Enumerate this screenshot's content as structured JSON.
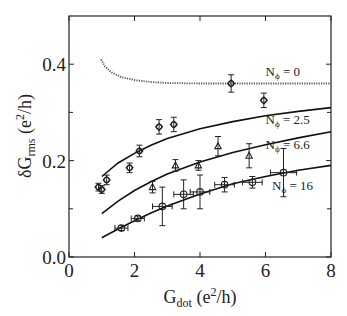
{
  "chart_data": {
    "type": "scatter",
    "title": "",
    "xlabel": "G_dot (e^2/h)",
    "ylabel": "δG_rms (e^2/h)",
    "xlim": [
      0,
      8
    ],
    "ylim": [
      0,
      0.5
    ],
    "x_ticks": [
      0,
      2,
      4,
      6,
      8
    ],
    "x_tick_labels": [
      "0",
      "2",
      "4",
      "6",
      "8"
    ],
    "y_ticks": [
      0.0,
      0.2,
      0.4
    ],
    "y_tick_labels": [
      "0.0",
      "0.2",
      "0.4"
    ],
    "y_minor_ticks": [
      0.1,
      0.3
    ],
    "grid": false,
    "series": [
      {
        "name": "Nφ = 0",
        "label_main": "N",
        "label_sub": "ϕ",
        "label_rest": " = 0",
        "marker": "circle-diamond",
        "points": [
          {
            "x": 4.95,
            "y": 0.36,
            "yerr": 0.018
          },
          {
            "x": 5.95,
            "y": 0.325,
            "yerr": 0.015
          }
        ],
        "curve_style": "dotted",
        "curve": [
          [
            0.98,
            0.41
          ],
          [
            1.1,
            0.395
          ],
          [
            1.3,
            0.383
          ],
          [
            1.6,
            0.373
          ],
          [
            2.0,
            0.367
          ],
          [
            2.5,
            0.363
          ],
          [
            3.0,
            0.361
          ],
          [
            4.0,
            0.36
          ],
          [
            5.0,
            0.36
          ],
          [
            6.0,
            0.36
          ],
          [
            7.0,
            0.36
          ],
          [
            8.0,
            0.36
          ]
        ],
        "label_pos": [
          6.0,
          0.375
        ]
      },
      {
        "name": "Nφ = 2.5",
        "label_main": "N",
        "label_sub": "ϕ",
        "label_rest": " = 2.5",
        "marker": "circle-diamond",
        "points": [
          {
            "x": 0.9,
            "y": 0.145,
            "yerr": 0.008
          },
          {
            "x": 1.0,
            "y": 0.14,
            "yerr": 0.008
          },
          {
            "x": 1.15,
            "y": 0.16,
            "yerr": 0.01
          },
          {
            "x": 1.85,
            "y": 0.185,
            "yerr": 0.01
          },
          {
            "x": 2.15,
            "y": 0.22,
            "yerr": 0.012
          },
          {
            "x": 2.75,
            "y": 0.27,
            "yerr": 0.015
          },
          {
            "x": 3.2,
            "y": 0.275,
            "yerr": 0.015
          }
        ],
        "curve_style": "solid",
        "curve": [
          [
            1.0,
            0.167
          ],
          [
            1.5,
            0.195
          ],
          [
            2.0,
            0.215
          ],
          [
            2.5,
            0.232
          ],
          [
            3.0,
            0.246
          ],
          [
            4.0,
            0.266
          ],
          [
            5.0,
            0.281
          ],
          [
            6.0,
            0.293
          ],
          [
            7.0,
            0.302
          ],
          [
            8.0,
            0.31
          ]
        ],
        "label_pos": [
          6.0,
          0.275
        ]
      },
      {
        "name": "Nφ = 6.6",
        "label_main": "N",
        "label_sub": "ϕ",
        "label_rest": " = 6.6",
        "marker": "triangle",
        "points": [
          {
            "x": 2.55,
            "y": 0.145,
            "yerr": 0.012
          },
          {
            "x": 3.25,
            "y": 0.19,
            "yerr": 0.012
          },
          {
            "x": 3.95,
            "y": 0.19,
            "yerr": 0.01
          },
          {
            "x": 4.55,
            "y": 0.23,
            "yerr": 0.02
          },
          {
            "x": 5.5,
            "y": 0.21,
            "yerr": 0.025
          }
        ],
        "curve_style": "solid",
        "curve": [
          [
            1.0,
            0.09
          ],
          [
            1.5,
            0.116
          ],
          [
            2.0,
            0.138
          ],
          [
            2.5,
            0.156
          ],
          [
            3.0,
            0.172
          ],
          [
            4.0,
            0.197
          ],
          [
            5.0,
            0.217
          ],
          [
            6.0,
            0.233
          ],
          [
            7.0,
            0.247
          ],
          [
            8.0,
            0.26
          ]
        ],
        "label_pos": [
          6.0,
          0.225
        ]
      },
      {
        "name": "Nφ = 16",
        "label_main": "N",
        "label_sub": "ϕ",
        "label_rest": " = 16",
        "marker": "circle",
        "points": [
          {
            "x": 1.6,
            "y": 0.06,
            "yerr": 0.005,
            "xerr": 0.2
          },
          {
            "x": 2.1,
            "y": 0.08,
            "yerr": 0.005,
            "xerr": 0.2
          },
          {
            "x": 2.85,
            "y": 0.105,
            "yerr": 0.04,
            "xerr": 0.3
          },
          {
            "x": 3.5,
            "y": 0.13,
            "yerr": 0.03,
            "xerr": 0.3
          },
          {
            "x": 4.0,
            "y": 0.135,
            "yerr": 0.035,
            "xerr": 0.3
          },
          {
            "x": 4.75,
            "y": 0.15,
            "yerr": 0.015,
            "xerr": 0.3
          },
          {
            "x": 5.6,
            "y": 0.155,
            "yerr": 0.012,
            "xerr": 0.3
          },
          {
            "x": 6.55,
            "y": 0.175,
            "yerr": 0.05,
            "xerr": 0.4
          }
        ],
        "curve_style": "solid",
        "curve": [
          [
            1.0,
            0.04
          ],
          [
            1.5,
            0.058
          ],
          [
            2.0,
            0.075
          ],
          [
            2.5,
            0.091
          ],
          [
            3.0,
            0.106
          ],
          [
            4.0,
            0.131
          ],
          [
            5.0,
            0.152
          ],
          [
            6.0,
            0.167
          ],
          [
            7.0,
            0.18
          ],
          [
            8.0,
            0.19
          ]
        ],
        "label_pos": [
          6.2,
          0.14
        ]
      }
    ]
  },
  "axes": {
    "x_title_main": "G",
    "x_title_sub": "dot",
    "x_title_unit_open": " (e",
    "x_title_sup": "2",
    "x_title_unit_close": "/h)",
    "y_title_main": "δG",
    "y_title_sub": "rms",
    "y_title_unit_open": " (e",
    "y_title_sup": "2",
    "y_title_unit_close": "/h)"
  }
}
